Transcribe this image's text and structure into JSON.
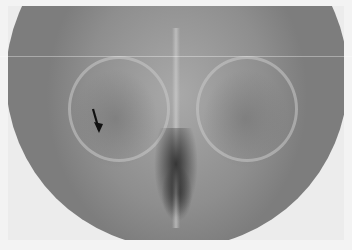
{
  "image": {
    "subject": "frontal radiograph of skull showing orbits and nasal cavity",
    "annotation": {
      "type": "arrow",
      "icon": "arrow-down-icon",
      "color": "#111111",
      "position": "left orbit"
    },
    "colors": {
      "background": "#f3f3f3",
      "film_mid": "#9a9a9a",
      "film_dark": "#333333"
    }
  }
}
